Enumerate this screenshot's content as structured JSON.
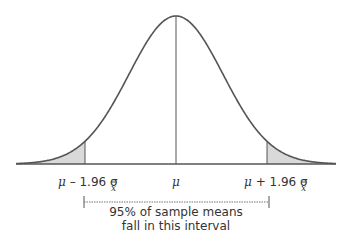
{
  "diagram": {
    "labels": {
      "left": "μ – 1.96 σ",
      "center": "μ",
      "right": "μ + 1.96 σ",
      "subscript": "x̄"
    },
    "annotation": {
      "line1": "95% of sample means",
      "line2": "fall in this interval"
    },
    "colors": {
      "curve": "#555555",
      "shade": "#d9d9d9",
      "text": "#333333"
    }
  }
}
